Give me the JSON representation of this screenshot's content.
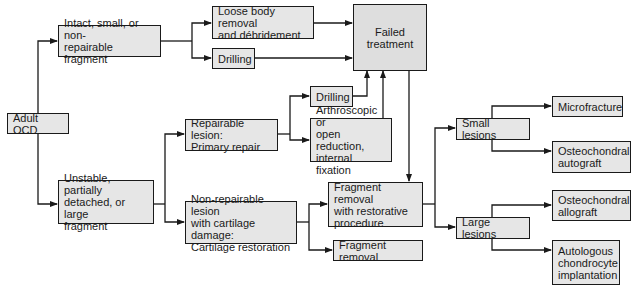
{
  "diagram": {
    "nodes": {
      "adult_ocd": "Adult OCD",
      "intact": "Intact, small, or non-\nrepairable fragment",
      "loose_body": "Loose body removal\nand débridement",
      "drilling_top": "Drilling",
      "failed": "Failed\ntreatment",
      "unstable": "Unstable, partially\ndetached, or large\nfragment",
      "repairable": "Repairable lesion:\nPrimary repair",
      "drilling_mid": "Drilling",
      "arthroscopic": "Arthroscopic or\nopen reduction,\ninternal fixation",
      "non_repairable": "Non-repairable lesion\nwith cartilage damage:\nCartilage restoration",
      "fragment_restorative": "Fragment removal\nwith restorative\nprocedure",
      "fragment_removal": "Fragment removal",
      "small_lesions": "Small lesions",
      "large_lesions": "Large lesions",
      "microfracture": "Microfracture",
      "oc_autograft": "Osteochondral\nautograft",
      "oc_allograft": "Osteochondral\nallograft",
      "aci": "Autologous\nchondrocyte\nimplantation"
    },
    "edges": [
      [
        "adult_ocd",
        "intact"
      ],
      [
        "adult_ocd",
        "unstable"
      ],
      [
        "intact",
        "loose_body"
      ],
      [
        "intact",
        "drilling_top"
      ],
      [
        "loose_body",
        "failed"
      ],
      [
        "drilling_top",
        "failed"
      ],
      [
        "unstable",
        "repairable"
      ],
      [
        "unstable",
        "non_repairable"
      ],
      [
        "repairable",
        "drilling_mid"
      ],
      [
        "repairable",
        "arthroscopic"
      ],
      [
        "drilling_mid",
        "failed"
      ],
      [
        "arthroscopic",
        "failed"
      ],
      [
        "failed",
        "fragment_restorative"
      ],
      [
        "non_repairable",
        "fragment_restorative"
      ],
      [
        "non_repairable",
        "fragment_removal"
      ],
      [
        "fragment_restorative",
        "small_lesions"
      ],
      [
        "fragment_restorative",
        "large_lesions"
      ],
      [
        "small_lesions",
        "microfracture"
      ],
      [
        "small_lesions",
        "oc_autograft"
      ],
      [
        "large_lesions",
        "oc_allograft"
      ],
      [
        "large_lesions",
        "aci"
      ]
    ]
  }
}
